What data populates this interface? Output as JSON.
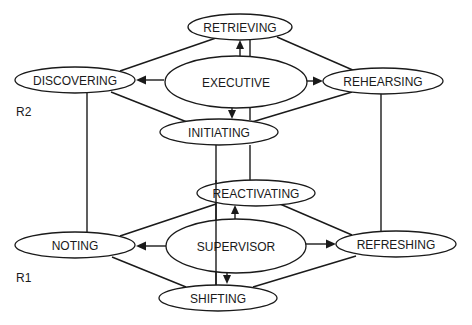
{
  "diagram": {
    "regions": [
      {
        "id": "R2",
        "label": "R2"
      },
      {
        "id": "R1",
        "label": "R1"
      }
    ],
    "nodes": {
      "retrieving": {
        "label": "RETRIEVING"
      },
      "executive": {
        "label": "EXECUTIVE"
      },
      "discovering": {
        "label": "DISCOVERING"
      },
      "rehearsing": {
        "label": "REHEARSING"
      },
      "initiating": {
        "label": "INITIATING"
      },
      "reactivating": {
        "label": "REACTIVATING"
      },
      "supervisor": {
        "label": "SUPERVISOR"
      },
      "noting": {
        "label": "NOTING"
      },
      "refreshing": {
        "label": "REFRESHING"
      },
      "shifting": {
        "label": "SHIFTING"
      }
    },
    "edges": [
      {
        "from": "EXECUTIVE",
        "to": "RETRIEVING",
        "directed": true
      },
      {
        "from": "EXECUTIVE",
        "to": "DISCOVERING",
        "directed": true
      },
      {
        "from": "EXECUTIVE",
        "to": "REHEARSING",
        "directed": true
      },
      {
        "from": "EXECUTIVE",
        "to": "INITIATING",
        "directed": true
      },
      {
        "from": "RETRIEVING",
        "to": "DISCOVERING",
        "directed": false
      },
      {
        "from": "RETRIEVING",
        "to": "REHEARSING",
        "directed": false
      },
      {
        "from": "INITIATING",
        "to": "DISCOVERING",
        "directed": false
      },
      {
        "from": "INITIATING",
        "to": "REHEARSING",
        "directed": false
      },
      {
        "from": "SUPERVISOR",
        "to": "REACTIVATING",
        "directed": true
      },
      {
        "from": "SUPERVISOR",
        "to": "NOTING",
        "directed": true
      },
      {
        "from": "SUPERVISOR",
        "to": "REFRESHING",
        "directed": true
      },
      {
        "from": "SUPERVISOR",
        "to": "SHIFTING",
        "directed": true
      },
      {
        "from": "REACTIVATING",
        "to": "NOTING",
        "directed": false
      },
      {
        "from": "REACTIVATING",
        "to": "REFRESHING",
        "directed": false
      },
      {
        "from": "SHIFTING",
        "to": "NOTING",
        "directed": false
      },
      {
        "from": "SHIFTING",
        "to": "REFRESHING",
        "directed": false
      },
      {
        "from": "DISCOVERING",
        "to": "NOTING",
        "directed": false
      },
      {
        "from": "REHEARSING",
        "to": "REFRESHING",
        "directed": false
      },
      {
        "from": "INITIATING",
        "to": "SHIFTING",
        "directed": false
      },
      {
        "from": "INITIATING",
        "to": "REACTIVATING",
        "directed": false
      },
      {
        "from": "RETRIEVING",
        "to": "INITIATING",
        "directed": false
      }
    ]
  }
}
